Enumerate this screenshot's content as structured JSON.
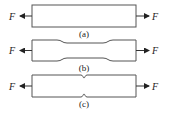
{
  "figure": {
    "force_symbol": "F",
    "panels": [
      {
        "id": "a",
        "caption": "(a)",
        "shape": "plain-bar"
      },
      {
        "id": "b",
        "caption": "(b)",
        "shape": "necked-specimen"
      },
      {
        "id": "c",
        "caption": "(c)",
        "shape": "notched-bar"
      }
    ],
    "colors": {
      "stroke": "#555555",
      "text": "#222222",
      "background": "#ffffff"
    }
  }
}
